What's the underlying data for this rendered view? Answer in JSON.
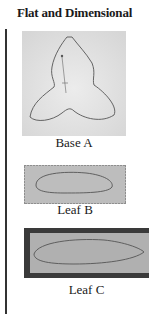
{
  "page": {
    "title": "Flat and Dimensional"
  },
  "figures": [
    {
      "id": "base-a",
      "caption": "Base A",
      "shape": "trefoil-outline",
      "fabric_color": "#e4e4e4"
    },
    {
      "id": "leaf-b",
      "caption": "Leaf B",
      "shape": "leaf-outline",
      "fabric_color": "#bdbdbd"
    },
    {
      "id": "leaf-c",
      "caption": "Leaf C",
      "shape": "leaf-outline",
      "fabric_color": "#b0b0b0",
      "border_color": "#3a3a3a"
    }
  ]
}
